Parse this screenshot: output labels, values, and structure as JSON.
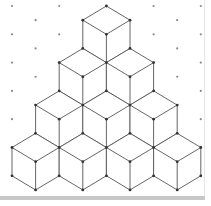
{
  "diagram": {
    "title": "",
    "type": "isometric-dot-grid-cube-pyramid",
    "grid": {
      "origin_x": 12,
      "origin_y": 6,
      "x_unit": 23.6,
      "y_unit": 14.15,
      "columns": 9,
      "rows": 14,
      "dot_color": "#8a8a8a",
      "dot_radius": 1.1
    },
    "cubes": {
      "rows": [
        1,
        2,
        3,
        4
      ],
      "total": 10,
      "apex_x": 106.4,
      "apex_y": 6,
      "stroke_color": "#555555",
      "vertex_color": "#333333",
      "fill_color": "#ffffff"
    },
    "colors": {
      "background": "#ffffff",
      "bottom_bar": "#c8c8c8",
      "right_border": "#e6e6e6"
    }
  }
}
